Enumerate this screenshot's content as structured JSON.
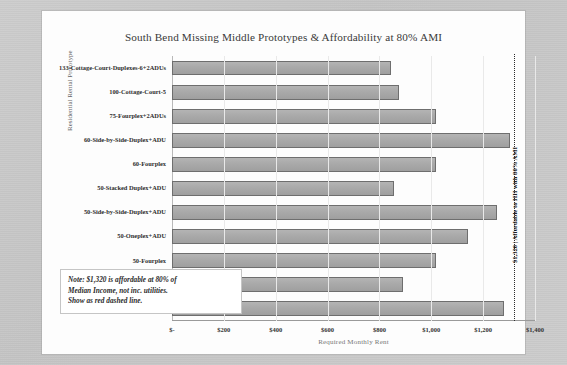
{
  "chart_data": {
    "type": "bar",
    "orientation": "horizontal",
    "title": "South Bend Missing Middle Prototypes & Affordability at 80% AMI",
    "xlabel": "Required Monthly Rent",
    "ylabel": "Residential Rental Prototype",
    "xlim": [
      0,
      1400
    ],
    "xticks": [
      0,
      200,
      400,
      600,
      800,
      1000,
      1200,
      1400
    ],
    "xtick_labels": [
      "$-",
      "$200",
      "$400",
      "$600",
      "$800",
      "$1,000",
      "$1,200",
      "$1,400"
    ],
    "grid": true,
    "legend": "none",
    "categories": [
      "133-Cottage-Court-Duplexes-6+2ADUs",
      "100-Cottage-Court-5",
      "75-Fourplex+2ADUs",
      "60-Side-by-Side-Duplex+ADU",
      "60-Fourplex",
      "50-Stacked Duplex+ADU",
      "50-Side-by-Side-Duplex+ADU",
      "50-Oneplex+ADU",
      "50-Fourplex",
      "30-Stacked Duplex",
      "30-Oneplex 1200sf"
    ],
    "values": [
      845,
      875,
      1020,
      1305,
      1020,
      855,
      1255,
      1140,
      1020,
      890,
      1280
    ],
    "bar_color": "#a9a9a9",
    "bar_edge_color": "#6e6e6e",
    "annotations": [
      {
        "name": "affordability-threshold",
        "value": 1320,
        "label": "$1,320 | Affordable to HH with 80% AMI",
        "style": "dotted-vertical-line",
        "color": "#2b2b2b"
      }
    ],
    "note": {
      "line1": "Note: $1,320 is affordable at 80% of",
      "line2": "Median Income, not inc. utilities.",
      "line3": "Show as red dashed line."
    }
  }
}
